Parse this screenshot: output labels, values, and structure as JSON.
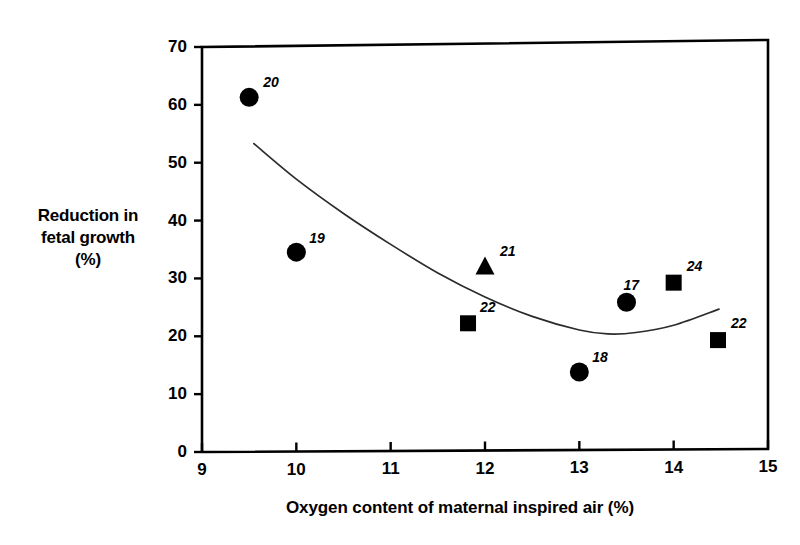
{
  "chart_data": {
    "type": "scatter",
    "title": "",
    "xlabel": "Oxygen content of maternal inspired air (%)",
    "ylabel": "Reduction in fetal growth (%)",
    "ylabel_lines": [
      "Reduction in",
      "fetal growth",
      "(%)"
    ],
    "xlim": [
      9,
      15
    ],
    "ylim": [
      0,
      70
    ],
    "xticks": [
      9,
      10,
      11,
      12,
      13,
      14,
      15
    ],
    "xtick_labels": [
      "9",
      "10",
      "11",
      "12",
      "13",
      "14",
      "15"
    ],
    "yticks": [
      0,
      10,
      20,
      30,
      40,
      50,
      60,
      70
    ],
    "ytick_labels": [
      "0",
      "10",
      "20",
      "30",
      "40",
      "50",
      "60",
      "70"
    ],
    "grid": false,
    "legend": "none",
    "marker_color": "#000000",
    "line_color": "#2b2b2b",
    "points": [
      {
        "label": "20",
        "x": 9.5,
        "y": 61.2,
        "marker": "circle",
        "label_dx": 14,
        "label_dy": -16
      },
      {
        "label": "19",
        "x": 10.0,
        "y": 34.4,
        "marker": "circle",
        "label_dx": 13,
        "label_dy": -15
      },
      {
        "label": "22",
        "x": 11.82,
        "y": 21.9,
        "marker": "square",
        "label_dx": 12,
        "label_dy": -17
      },
      {
        "label": "21",
        "x": 12.0,
        "y": 31.5,
        "marker": "triangle",
        "label_dx": 15,
        "label_dy": -17
      },
      {
        "label": "18",
        "x": 13.0,
        "y": 13.4,
        "marker": "circle",
        "label_dx": 13,
        "label_dy": -16
      },
      {
        "label": "17",
        "x": 13.5,
        "y": 25.3,
        "marker": "circle",
        "label_dx": -3,
        "label_dy": -18
      },
      {
        "label": "24",
        "x": 14.0,
        "y": 28.6,
        "marker": "square",
        "label_dx": 13,
        "label_dy": -18
      },
      {
        "label": "22",
        "x": 14.47,
        "y": 18.7,
        "marker": "square",
        "label_dx": 13,
        "label_dy": -18
      }
    ],
    "trend_curve": {
      "type": "quadratic-fit",
      "x_start": 9.55,
      "x_end": 14.48,
      "points": [
        {
          "x": 9.55,
          "y": 53.2
        },
        {
          "x": 10.0,
          "y": 47.0
        },
        {
          "x": 10.5,
          "y": 41.0
        },
        {
          "x": 11.0,
          "y": 35.6
        },
        {
          "x": 11.5,
          "y": 30.6
        },
        {
          "x": 12.0,
          "y": 26.4
        },
        {
          "x": 12.5,
          "y": 23.0
        },
        {
          "x": 13.0,
          "y": 20.6
        },
        {
          "x": 13.3,
          "y": 19.9
        },
        {
          "x": 13.6,
          "y": 20.1
        },
        {
          "x": 14.0,
          "y": 21.3
        },
        {
          "x": 14.48,
          "y": 24.0
        }
      ]
    }
  },
  "axis": {
    "x_title": "Oxygen content of maternal inspired air (%)",
    "y_title_line1": "Reduction in",
    "y_title_line2": "fetal growth",
    "y_title_line3": "(%)"
  }
}
